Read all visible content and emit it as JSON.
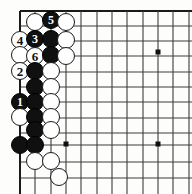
{
  "diagram": {
    "kind": "go-board-diagram",
    "board_size": 19,
    "view": {
      "corner": "upper-left",
      "visible_columns": [
        "A",
        "B",
        "C",
        "D",
        "E",
        "F",
        "G",
        "H",
        "I",
        "J",
        "K"
      ],
      "visible_rows": [
        1,
        2,
        3,
        4,
        5,
        6,
        7,
        8,
        9,
        10,
        11,
        12
      ],
      "origin_px": {
        "x": 20,
        "y": 11
      },
      "spacing_px": 15.3
    },
    "colors": {
      "background": "#fdfdfb",
      "line": "#3c3c3c",
      "edge_line": "#1a1a1a",
      "black_stone": "#101010",
      "white_stone": "#ffffff",
      "stone_outline": "#1a1a1a",
      "star_point": "#101010"
    },
    "star_points": [
      {
        "col": 4,
        "row": 10,
        "x": 66,
        "y": 144
      },
      {
        "col": 10,
        "row": 4,
        "x": 158,
        "y": 52
      },
      {
        "col": 10,
        "row": 10,
        "x": 158,
        "y": 144
      }
    ],
    "stone_radius_px": 9,
    "stones": [
      {
        "id": "w-b1",
        "color": "white",
        "label": "",
        "col": 2,
        "row": 1,
        "x": 35,
        "y": 22
      },
      {
        "id": "b-c1",
        "color": "black",
        "label": "5",
        "col": 3,
        "row": 1,
        "x": 51,
        "y": 20
      },
      {
        "id": "w-d1",
        "color": "white",
        "label": "",
        "col": 4,
        "row": 1,
        "x": 66,
        "y": 22
      },
      {
        "id": "w-a2",
        "color": "white",
        "label": "4",
        "col": 1,
        "row": 2,
        "x": 20,
        "y": 40
      },
      {
        "id": "b-b2",
        "color": "black",
        "label": "3",
        "col": 2,
        "row": 2,
        "x": 35,
        "y": 39
      },
      {
        "id": "b-c2",
        "color": "black",
        "label": "",
        "col": 3,
        "row": 2,
        "x": 51,
        "y": 39
      },
      {
        "id": "w-d2",
        "color": "white",
        "label": "",
        "col": 4,
        "row": 2,
        "x": 66,
        "y": 40
      },
      {
        "id": "w-a3",
        "color": "white",
        "label": "",
        "col": 1,
        "row": 3,
        "x": 20,
        "y": 55
      },
      {
        "id": "w-b3",
        "color": "white",
        "label": "6",
        "col": 2,
        "row": 3,
        "x": 35,
        "y": 56
      },
      {
        "id": "b-c3",
        "color": "black",
        "label": "",
        "col": 3,
        "row": 3,
        "x": 51,
        "y": 55
      },
      {
        "id": "w-d3",
        "color": "white",
        "label": "",
        "col": 4,
        "row": 3,
        "x": 66,
        "y": 56
      },
      {
        "id": "w-a4",
        "color": "white",
        "label": "2",
        "col": 1,
        "row": 4,
        "x": 20,
        "y": 71
      },
      {
        "id": "b-b4",
        "color": "black",
        "label": "",
        "col": 2,
        "row": 4,
        "x": 35,
        "y": 71
      },
      {
        "id": "w-c4",
        "color": "white",
        "label": "",
        "col": 3,
        "row": 4,
        "x": 51,
        "y": 71
      },
      {
        "id": "b-b5",
        "color": "black",
        "label": "",
        "col": 2,
        "row": 5,
        "x": 35,
        "y": 87
      },
      {
        "id": "w-c5",
        "color": "white",
        "label": "",
        "col": 3,
        "row": 5,
        "x": 51,
        "y": 87
      },
      {
        "id": "b-a6",
        "color": "black",
        "label": "1",
        "col": 1,
        "row": 6,
        "x": 20,
        "y": 102
      },
      {
        "id": "b-b6",
        "color": "black",
        "label": "",
        "col": 2,
        "row": 6,
        "x": 35,
        "y": 102
      },
      {
        "id": "w-c6",
        "color": "white",
        "label": "",
        "col": 3,
        "row": 6,
        "x": 51,
        "y": 102
      },
      {
        "id": "w-a7",
        "color": "white",
        "label": "",
        "col": 1,
        "row": 7,
        "x": 20,
        "y": 117
      },
      {
        "id": "b-b7",
        "color": "black",
        "label": "",
        "col": 2,
        "row": 7,
        "x": 35,
        "y": 117
      },
      {
        "id": "w-c7",
        "color": "white",
        "label": "",
        "col": 3,
        "row": 7,
        "x": 51,
        "y": 117
      },
      {
        "id": "b-b8",
        "color": "black",
        "label": "",
        "col": 2,
        "row": 8,
        "x": 35,
        "y": 130
      },
      {
        "id": "w-c8",
        "color": "white",
        "label": "",
        "col": 3,
        "row": 8,
        "x": 51,
        "y": 130
      },
      {
        "id": "b-a9",
        "color": "black",
        "label": "",
        "col": 1,
        "row": 9,
        "x": 20,
        "y": 145
      },
      {
        "id": "b-b9",
        "color": "black",
        "label": "",
        "col": 2,
        "row": 9,
        "x": 35,
        "y": 145
      },
      {
        "id": "w-b10",
        "color": "white",
        "label": "",
        "col": 2,
        "row": 10,
        "x": 35,
        "y": 161
      },
      {
        "id": "w-c10",
        "color": "white",
        "label": "",
        "col": 3,
        "row": 10,
        "x": 51,
        "y": 161
      },
      {
        "id": "w-c11",
        "color": "white",
        "label": "",
        "col": 3,
        "row": 11,
        "x": 59,
        "y": 177
      }
    ],
    "move_sequence": [
      {
        "number": "1",
        "color": "black",
        "stone_id": "b-a6"
      },
      {
        "number": "2",
        "color": "white",
        "stone_id": "w-a4"
      },
      {
        "number": "3",
        "color": "black",
        "stone_id": "b-b2"
      },
      {
        "number": "4",
        "color": "white",
        "stone_id": "w-a2"
      },
      {
        "number": "5",
        "color": "black",
        "stone_id": "b-c1"
      },
      {
        "number": "6",
        "color": "white",
        "stone_id": "w-b3"
      }
    ]
  }
}
